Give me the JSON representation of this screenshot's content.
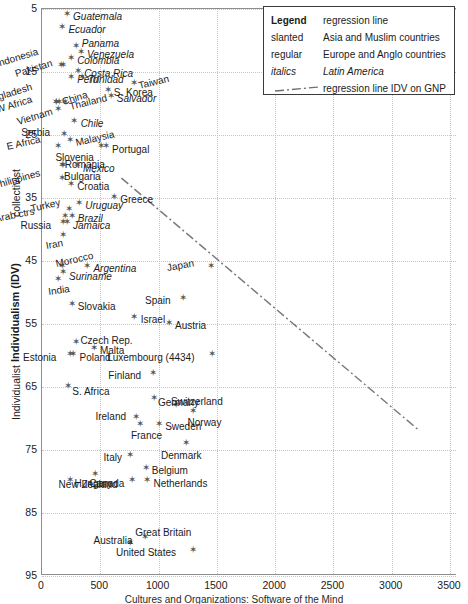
{
  "figure": {
    "caption_fragment": "Cultures and Organizations: Software of the Mind"
  },
  "legend": {
    "title": "Legend",
    "title_value": "regression line",
    "rows": [
      {
        "key": "slanted",
        "value": "Asia and Muslim countries",
        "style": "slanted"
      },
      {
        "key": "regular",
        "value": "Europe and Anglo countries",
        "style": "regular"
      },
      {
        "key": "italics",
        "value": "Latin America",
        "style": "italics"
      },
      {
        "key": "dashdot",
        "value": "regression line IDV on GNP",
        "style": "line"
      }
    ]
  },
  "axes": {
    "x": {
      "label": "",
      "ticks": [
        0,
        500,
        1000,
        1500,
        2000,
        2500,
        3000,
        3500
      ],
      "tick_labels": [
        "0",
        "500",
        "1000",
        "1500",
        "2000",
        "2500",
        "3000",
        "3500"
      ],
      "min": 0,
      "max": 3560,
      "grid": true
    },
    "y": {
      "label_main": "Individualism (IDV)",
      "label_low": "collectivist",
      "label_high": "Individualist",
      "ticks": [
        5,
        15,
        25,
        35,
        45,
        55,
        65,
        75,
        85,
        95
      ],
      "tick_labels": [
        "5",
        "15",
        "25",
        "35",
        "45",
        "55",
        "65",
        "75",
        "85",
        "95"
      ],
      "min": 5,
      "max": 95,
      "inverted": true,
      "grid": true
    }
  },
  "chart_data": {
    "type": "scatter",
    "title": "",
    "xlabel": "GNP",
    "ylabel": "Individualism (IDV)",
    "xlim": [
      0,
      3560
    ],
    "ylim": [
      95,
      5
    ],
    "grid": true,
    "legend_position": "top-right",
    "annotations": [
      {
        "text": "Luxembourg (4434)",
        "note": "x value off-scale, shown at right edge"
      }
    ],
    "regression_line": {
      "label": "regression line IDV on GNP",
      "style": "dash-dot",
      "x_start": 690,
      "y_start": 32,
      "x_end": 3240,
      "y_end": 72
    },
    "points": [
      {
        "label": "Guatemala",
        "x": 215,
        "y": 6,
        "group": "italics",
        "lab_dx": 7,
        "lab_dy": 3
      },
      {
        "label": "Ecuador",
        "x": 175,
        "y": 8,
        "group": "italics",
        "lab_dx": 7,
        "lab_dy": 3
      },
      {
        "label": "Panama",
        "x": 290,
        "y": 11,
        "group": "italics",
        "lab_dx": 7,
        "lab_dy": -2
      },
      {
        "label": "Venezuela",
        "x": 335,
        "y": 12,
        "group": "italics",
        "lab_dx": 7,
        "lab_dy": 3
      },
      {
        "label": "Indonesia",
        "x": 165,
        "y": 14,
        "group": "slanted",
        "lab_dx": -62,
        "lab_dy": -1,
        "rot": -17
      },
      {
        "label": "Colombia",
        "x": 250,
        "y": 13,
        "group": "italics",
        "lab_dx": 7,
        "lab_dy": 3
      },
      {
        "label": "Pakistan",
        "x": 185,
        "y": 14,
        "group": "slanted",
        "lab_dx": -46,
        "lab_dy": 9,
        "rot": -17
      },
      {
        "label": "Costa Rica",
        "x": 310,
        "y": 15,
        "group": "italics",
        "lab_dx": 7,
        "lab_dy": 3
      },
      {
        "label": "Peru",
        "x": 250,
        "y": 16,
        "group": "italics",
        "lab_dx": 7,
        "lab_dy": 3
      },
      {
        "label": "Trinidad",
        "x": 345,
        "y": 16,
        "group": "italics",
        "lab_dx": 7,
        "lab_dy": 3
      },
      {
        "label": "S. Korea",
        "x": 565,
        "y": 18,
        "group": "regular",
        "lab_dx": 7,
        "lab_dy": 3
      },
      {
        "label": "Taiwan",
        "x": 790,
        "y": 17,
        "group": "slanted",
        "lab_dx": 7,
        "lab_dy": 2,
        "rot": -14
      },
      {
        "label": "Salvador",
        "x": 590,
        "y": 19,
        "group": "italics",
        "lab_dx": 7,
        "lab_dy": 3
      },
      {
        "label": "Bangladesh",
        "x": 120,
        "y": 20,
        "group": "slanted",
        "lab_dx": -72,
        "lab_dy": -1,
        "rot": -17
      },
      {
        "label": "W Africa",
        "x": 125,
        "y": 20,
        "group": "slanted",
        "lab_dx": -58,
        "lab_dy": 7,
        "rot": -17
      },
      {
        "label": "China",
        "x": 145,
        "y": 20,
        "group": "slanted",
        "lab_dx": 6,
        "lab_dy": -1,
        "rot": -17
      },
      {
        "label": "Vietnam",
        "x": 135,
        "y": 21,
        "group": "slanted",
        "lab_dx": -38,
        "lab_dy": 13,
        "rot": -17
      },
      {
        "label": "Thailand",
        "x": 195,
        "y": 20,
        "group": "slanted",
        "lab_dx": 7,
        "lab_dy": 4,
        "rot": -14
      },
      {
        "label": "Chile",
        "x": 280,
        "y": 23,
        "group": "italics",
        "lab_dx": 7,
        "lab_dy": 3
      },
      {
        "label": "Serbia",
        "x": 190,
        "y": 25,
        "group": "regular",
        "lab_dx": -42,
        "lab_dy": -1
      },
      {
        "label": "E Africa",
        "x": 135,
        "y": 27,
        "group": "slanted",
        "lab_dx": -49,
        "lab_dy": 0,
        "rot": -13
      },
      {
        "label": "Malaysia",
        "x": 245,
        "y": 26,
        "group": "slanted",
        "lab_dx": 7,
        "lab_dy": 3,
        "rot": -13
      },
      {
        "label": "Slovenia",
        "x": 510,
        "y": 27,
        "group": "regular",
        "lab_dx": -45,
        "lab_dy": 11
      },
      {
        "label": "Portugal",
        "x": 550,
        "y": 27,
        "group": "regular",
        "lab_dx": 7,
        "lab_dy": 3
      },
      {
        "label": "Romania",
        "x": 170,
        "y": 30,
        "group": "regular",
        "lab_dx": 4,
        "lab_dy": -1
      },
      {
        "label": "Mexico",
        "x": 300,
        "y": 30,
        "group": "italics",
        "lab_dx": 7,
        "lab_dy": 3
      },
      {
        "label": "Bulgaria",
        "x": 180,
        "y": 30,
        "group": "regular",
        "lab_dx": 2,
        "lab_dy": 11
      },
      {
        "label": "Philippines",
        "x": 170,
        "y": 32,
        "group": "slanted",
        "lab_dx": -66,
        "lab_dy": 8,
        "rot": -16
      },
      {
        "label": "Croatia",
        "x": 250,
        "y": 33,
        "group": "regular",
        "lab_dx": 7,
        "lab_dy": 3
      },
      {
        "label": "Greece",
        "x": 620,
        "y": 35,
        "group": "regular",
        "lab_dx": 7,
        "lab_dy": 3
      },
      {
        "label": "Turkey",
        "x": 230,
        "y": 37,
        "group": "slanted",
        "lab_dx": -36,
        "lab_dy": -1,
        "rot": -13
      },
      {
        "label": "Arab ctrs",
        "x": 200,
        "y": 38,
        "group": "slanted",
        "lab_dx": -68,
        "lab_dy": 3,
        "rot": -11
      },
      {
        "label": "Uruguay",
        "x": 320,
        "y": 36,
        "group": "italics",
        "lab_dx": 7,
        "lab_dy": 3
      },
      {
        "label": "Brazil",
        "x": 255,
        "y": 38,
        "group": "italics",
        "lab_dx": 7,
        "lab_dy": 3
      },
      {
        "label": "Russia",
        "x": 185,
        "y": 39,
        "group": "slanted",
        "lab_dx": -42,
        "lab_dy": 4
      },
      {
        "label": "Jamaica",
        "x": 215,
        "y": 39,
        "group": "italics",
        "lab_dx": 7,
        "lab_dy": 4
      },
      {
        "label": "Iran",
        "x": 185,
        "y": 41,
        "group": "slanted",
        "lab_dx": -16,
        "lab_dy": 11,
        "rot": -10
      },
      {
        "label": "Morocco",
        "x": 170,
        "y": 46,
        "group": "slanted",
        "lab_dx": -4,
        "lab_dy": -2,
        "rot": -13
      },
      {
        "label": "Argentina",
        "x": 390,
        "y": 46,
        "group": "italics",
        "lab_dx": 7,
        "lab_dy": 3
      },
      {
        "label": "Suriname",
        "x": 180,
        "y": 47,
        "group": "italics",
        "lab_dx": 7,
        "lab_dy": 4
      },
      {
        "label": "India",
        "x": 140,
        "y": 48,
        "group": "slanted",
        "lab_dx": -8,
        "lab_dy": 13,
        "rot": -8
      },
      {
        "label": "Japan",
        "x": 1450,
        "y": 46,
        "group": "slanted",
        "lab_dx": -42,
        "lab_dy": 2,
        "rot": -10
      },
      {
        "label": "Slovakia",
        "x": 255,
        "y": 52,
        "group": "regular",
        "lab_dx": 7,
        "lab_dy": 3
      },
      {
        "label": "Spain",
        "x": 1210,
        "y": 51,
        "group": "regular",
        "lab_dx": -37,
        "lab_dy": 3
      },
      {
        "label": "Israel",
        "x": 795,
        "y": 54,
        "group": "regular",
        "lab_dx": 7,
        "lab_dy": 3
      },
      {
        "label": "Austria",
        "x": 1090,
        "y": 55,
        "group": "regular",
        "lab_dx": 7,
        "lab_dy": 3
      },
      {
        "label": "Czech Rep.",
        "x": 295,
        "y": 58,
        "group": "regular",
        "lab_dx": 5,
        "lab_dy": -1
      },
      {
        "label": "Estonia",
        "x": 240,
        "y": 60,
        "group": "regular",
        "lab_dx": -46,
        "lab_dy": 3
      },
      {
        "label": "Poland",
        "x": 270,
        "y": 60,
        "group": "regular",
        "lab_dx": 7,
        "lab_dy": 3
      },
      {
        "label": "Malta",
        "x": 445,
        "y": 59,
        "group": "regular",
        "lab_dx": 7,
        "lab_dy": 3
      },
      {
        "label": "Luxembourg (4434)",
        "x": 1460,
        "y": 60,
        "group": "regular",
        "lab_dx": -104,
        "lab_dy": 3
      },
      {
        "label": "S. Africa",
        "x": 225,
        "y": 65,
        "group": "regular",
        "lab_dx": 5,
        "lab_dy": 6
      },
      {
        "label": "Finland",
        "x": 955,
        "y": 63,
        "group": "regular",
        "lab_dx": -44,
        "lab_dy": 3
      },
      {
        "label": "Germany",
        "x": 960,
        "y": 67,
        "group": "regular",
        "lab_dx": 5,
        "lab_dy": 4
      },
      {
        "label": "Switzerland",
        "x": 1150,
        "y": 68,
        "group": "regular",
        "lab_dx": -4,
        "lab_dy": -3
      },
      {
        "label": "Ireland",
        "x": 810,
        "y": 70,
        "group": "regular",
        "lab_dx": -40,
        "lab_dy": -1
      },
      {
        "label": "Norway",
        "x": 1300,
        "y": 69,
        "group": "regular",
        "lab_dx": -5,
        "lab_dy": 12
      },
      {
        "label": "France",
        "x": 840,
        "y": 71,
        "group": "regular",
        "lab_dx": -8,
        "lab_dy": 12
      },
      {
        "label": "Sweden",
        "x": 1005,
        "y": 71,
        "group": "regular",
        "lab_dx": 7,
        "lab_dy": 3
      },
      {
        "label": "Denmark",
        "x": 1235,
        "y": 74,
        "group": "regular",
        "lab_dx": -24,
        "lab_dy": 13
      },
      {
        "label": "Italy",
        "x": 760,
        "y": 76,
        "group": "regular",
        "lab_dx": -26,
        "lab_dy": 3
      },
      {
        "label": "Belgium",
        "x": 890,
        "y": 78,
        "group": "regular",
        "lab_dx": 7,
        "lab_dy": 3
      },
      {
        "label": "Canada",
        "x": 775,
        "y": 80,
        "group": "regular",
        "lab_dx": -42,
        "lab_dy": 3
      },
      {
        "label": "Netherlands",
        "x": 905,
        "y": 80,
        "group": "regular",
        "lab_dx": 7,
        "lab_dy": 3
      },
      {
        "label": "Hungary",
        "x": 245,
        "y": 80,
        "group": "regular",
        "lab_dx": 5,
        "lab_dy": 3
      },
      {
        "label": "New Zealand",
        "x": 460,
        "y": 79,
        "group": "regular",
        "lab_dx": -36,
        "lab_dy": 11
      },
      {
        "label": "Australia",
        "x": 760,
        "y": 90,
        "group": "regular",
        "lab_dx": -36,
        "lab_dy": -3
      },
      {
        "label": "Great Britain",
        "x": 885,
        "y": 89,
        "group": "regular",
        "lab_dx": -9,
        "lab_dy": -4
      },
      {
        "label": "United States",
        "x": 1295,
        "y": 91,
        "group": "regular",
        "lab_dx": -76,
        "lab_dy": 3
      }
    ]
  }
}
